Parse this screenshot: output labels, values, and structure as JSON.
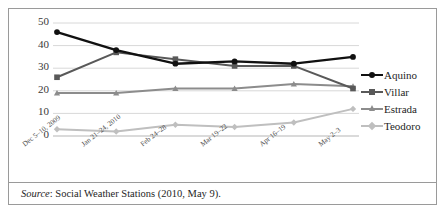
{
  "figure": {
    "source_prefix": "Source",
    "source_text": ": Social Weather Stations (2010, May 9)."
  },
  "chart_data": {
    "type": "line",
    "title": "",
    "xlabel": "",
    "ylabel": "",
    "ylim": [
      0,
      50
    ],
    "ytick_values": [
      50,
      40,
      30,
      20,
      10,
      0
    ],
    "ytick_labels": [
      "50",
      "40",
      "30",
      "20",
      "10",
      "0"
    ],
    "grid": true,
    "grid_axis": "y",
    "legend_position": "right",
    "categories": [
      "Dec 5–10, 2009",
      "Jan 21–24, 2010",
      "Feb 24–28",
      "Mar 19–22",
      "Apr 16–19",
      "May 2–3"
    ],
    "series": [
      {
        "name": "Aquino",
        "values": [
          46,
          38,
          32,
          33,
          32,
          35
        ],
        "color": "#111111",
        "marker": "circle"
      },
      {
        "name": "Villar",
        "values": [
          26,
          37,
          34,
          31,
          31,
          21
        ],
        "color": "#595959",
        "marker": "square"
      },
      {
        "name": "Estrada",
        "values": [
          19,
          19,
          21,
          21,
          23,
          22
        ],
        "color": "#8c8c8c",
        "marker": "triangle"
      },
      {
        "name": "Teodoro",
        "values": [
          3,
          2,
          5,
          4,
          6,
          12
        ],
        "color": "#bfbfbf",
        "marker": "diamond"
      }
    ]
  }
}
